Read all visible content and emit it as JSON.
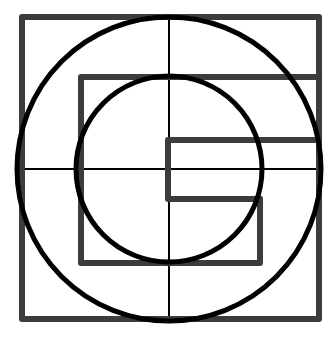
{
  "figure": {
    "colors": {
      "background": "#ffffff",
      "square_stroke": "#3c3c3c",
      "circle_stroke": "#000000",
      "cross_stroke": "#000000"
    },
    "center": [
      169,
      169
    ],
    "outer_square": {
      "x": 22,
      "y": 17,
      "w": 297,
      "h": 302,
      "stroke_width": 6
    },
    "inner_frame": {
      "points": "319,77 81,77 81,263 260,263 260,199",
      "stroke_width": 6
    },
    "small_rect": {
      "points": "319,140 168,140 168,199 260,199",
      "stroke_width": 6
    },
    "big_circle": {
      "cx": 169,
      "cy": 169,
      "r": 152,
      "stroke_width": 5
    },
    "small_circle": {
      "cx": 169,
      "cy": 169,
      "r": 93,
      "stroke_width": 5
    },
    "cross": {
      "vertical": {
        "x1": 169,
        "y1": 17,
        "x2": 169,
        "y2": 319
      },
      "horizontal": {
        "x1": 22,
        "y1": 169,
        "x2": 319,
        "y2": 169
      },
      "stroke_width": 2
    }
  }
}
